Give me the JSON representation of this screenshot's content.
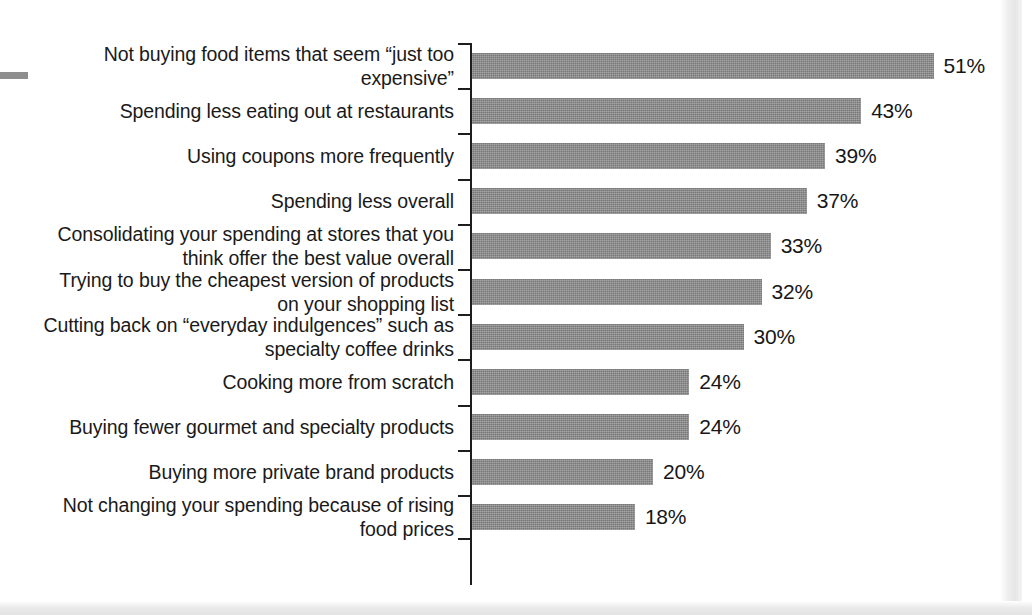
{
  "artifacts": {
    "margin_dash": "margin-dash-mark",
    "scan_edge_right": "page-scan-edge",
    "scan_edge_bottom": "page-scan-edge"
  },
  "chart_data": {
    "type": "bar",
    "orientation": "horizontal",
    "title": "",
    "subtitle": "",
    "xlabel": "",
    "ylabel": "",
    "xlim": [
      0,
      55
    ],
    "grid": false,
    "legend": null,
    "bar_color": "#8a8a8a",
    "value_suffix": "%",
    "categories": [
      "Not buying food items that seem “just too\nexpensive”",
      "Spending less eating out at restaurants",
      "Using coupons more frequently",
      "Spending less overall",
      "Consolidating your spending at stores that you\nthink offer the best value overall",
      "Trying to buy the cheapest version of products\non your shopping list",
      "Cutting back on “everyday indulgences” such as\nspecialty coffee drinks",
      "Cooking more from scratch",
      "Buying fewer gourmet and specialty products",
      "Buying more private brand products",
      "Not changing your spending because of rising\nfood prices"
    ],
    "values": [
      51,
      43,
      39,
      37,
      33,
      32,
      30,
      24,
      24,
      20,
      18
    ],
    "value_labels": [
      "51%",
      "43%",
      "39%",
      "37%",
      "33%",
      "32%",
      "30%",
      "24%",
      "24%",
      "20%",
      "18%"
    ]
  }
}
